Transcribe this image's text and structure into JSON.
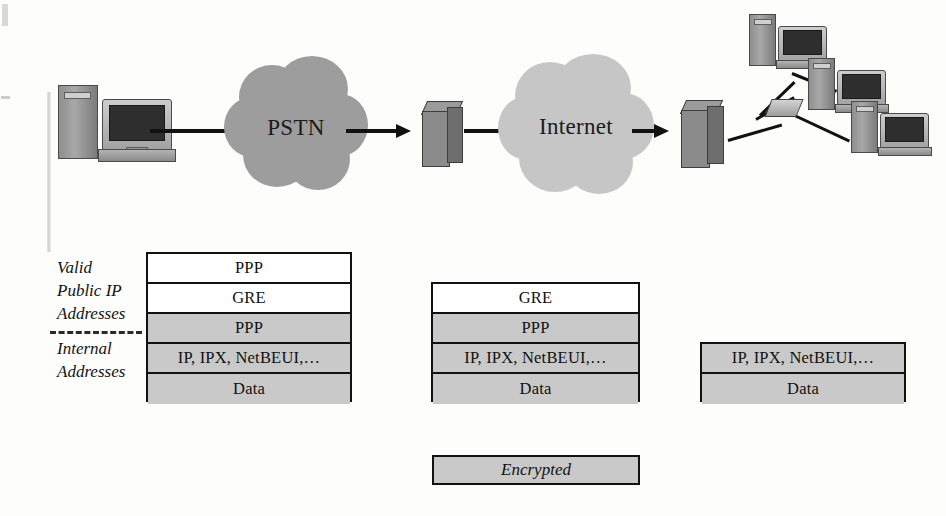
{
  "diagram": {
    "colors": {
      "pstn_cloud": "#9d9d9d",
      "internet_cloud": "#c6c6c6",
      "shaded_row": "#c9c9c9",
      "plain_row": "#ffffff",
      "line": "#111111"
    }
  },
  "network": {
    "client": {
      "name": "client-pc",
      "label": ""
    },
    "clouds": [
      {
        "id": "pstn",
        "label": "PSTN",
        "fill": "#9d9d9d"
      },
      {
        "id": "internet",
        "label": "Internet",
        "fill": "#c6c6c6"
      }
    ],
    "servers": [
      {
        "id": "nas-server",
        "label": ""
      },
      {
        "id": "vpn-gateway-server",
        "label": ""
      }
    ],
    "lan": {
      "hub": {
        "name": "lan-hub",
        "label": ""
      },
      "workstations": [
        {
          "id": "lan-pc-1",
          "label": ""
        },
        {
          "id": "lan-pc-2",
          "label": ""
        },
        {
          "id": "lan-pc-3",
          "label": ""
        }
      ]
    }
  },
  "side_labels": {
    "upper": [
      "Valid",
      "Public IP",
      "Addresses"
    ],
    "lower": [
      "Internal",
      "Addresses"
    ]
  },
  "stacks": [
    {
      "id": "stack-client-to-nas",
      "rows": [
        {
          "label": "PPP",
          "encrypted": false
        },
        {
          "label": "GRE",
          "encrypted": false
        },
        {
          "label": "PPP",
          "encrypted": true
        },
        {
          "label": "IP, IPX, NetBEUI,…",
          "encrypted": true
        },
        {
          "label": "Data",
          "encrypted": true
        }
      ]
    },
    {
      "id": "stack-nas-to-gateway",
      "rows": [
        {
          "label": "GRE",
          "encrypted": false
        },
        {
          "label": "PPP",
          "encrypted": true
        },
        {
          "label": "IP, IPX, NetBEUI,…",
          "encrypted": true
        },
        {
          "label": "Data",
          "encrypted": true
        }
      ]
    },
    {
      "id": "stack-gateway-to-lan",
      "rows": [
        {
          "label": "IP, IPX, NetBEUI,…",
          "encrypted": true
        },
        {
          "label": "Data",
          "encrypted": true
        }
      ]
    }
  ],
  "legend": {
    "label": "Encrypted"
  }
}
